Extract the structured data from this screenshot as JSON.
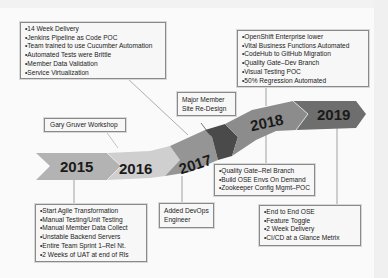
{
  "timeline": {
    "years": [
      "2015",
      "2016",
      "2017",
      "2018",
      "2019"
    ],
    "colors": {
      "seg2015": "#b3b3b3",
      "seg2016": "#cfcfcf",
      "seg2017": "#959595",
      "segMajor": "#4a4a4a",
      "seg2018": "#8c8c8c",
      "seg2019": "#6e6e6e"
    }
  },
  "boxes": {
    "top_2017": {
      "items": [
        "14 Week Delivery",
        "Jenkins Pipeline as Code POC",
        "Team trained to use Cucumber Automation",
        "Automated Tests were Brittle",
        "Member Data Validation",
        "Service Virtualization"
      ]
    },
    "gary": {
      "text": "Gary Gruver Workshop"
    },
    "major": {
      "line1": "Major Member",
      "line2": "Site Re-Design"
    },
    "top_2018": {
      "items": [
        "OpenShift Enterprise lower",
        "Vital Business Functions Automated",
        "CodeHub to GitHub Migration",
        "Quality Gate–Dev Branch",
        "Visual Testing POC",
        "50% Regression Automated"
      ]
    },
    "bottom_2015": {
      "items": [
        "Start Agile Transformation",
        "Manual Testing/Unit Testing",
        "Manual Member Data Collect",
        "Unstable Backend Servers",
        "Entire Team Sprint 1–Rel Nt.",
        "2 Weeks of UAT at end of Rls"
      ]
    },
    "devops": {
      "line1": "Added DevOps",
      "line2": "Engineer"
    },
    "bottom_2018": {
      "items": [
        "Quality Gate–Rel Branch",
        "Build OSE Envs On Demand",
        "Zookeeper Config Mgmt–POC"
      ]
    },
    "bottom_2019": {
      "items": [
        "End to End OSE",
        "Feature Toggle",
        "2 Week Delivery",
        "CI/CD at a Glance Metrix"
      ]
    }
  }
}
